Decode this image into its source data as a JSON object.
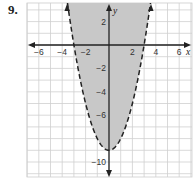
{
  "problem_number": "9.",
  "chart_data": {
    "type": "line",
    "title": "",
    "xlabel": "x",
    "ylabel": "y",
    "xlim": [
      -7,
      7
    ],
    "ylim": [
      -11,
      3.5
    ],
    "grid": true,
    "x_ticks": [
      -6,
      -4,
      -2,
      2,
      4,
      6
    ],
    "y_ticks": [
      2,
      -2,
      -4,
      -6,
      -10
    ],
    "x_tick_labels": [
      "−6",
      "−4",
      "−2",
      "2",
      "4",
      "6"
    ],
    "y_tick_labels": [
      "2",
      "−2",
      "−4",
      "−6",
      "−10"
    ],
    "series": [
      {
        "name": "y = x² − 9",
        "style": "dashed",
        "x": [
          -3.5,
          -3,
          -2,
          -1,
          0,
          1,
          2,
          3,
          3.5
        ],
        "y": [
          3.25,
          0,
          -5,
          -8,
          -9,
          -8,
          -5,
          0,
          3.25
        ]
      }
    ],
    "shaded_region": "inside parabola (y > x² − 9)",
    "shade_color": "#c8c8c8",
    "vertex": [
      0,
      -9
    ],
    "x_intercepts": [
      -3,
      3
    ]
  }
}
